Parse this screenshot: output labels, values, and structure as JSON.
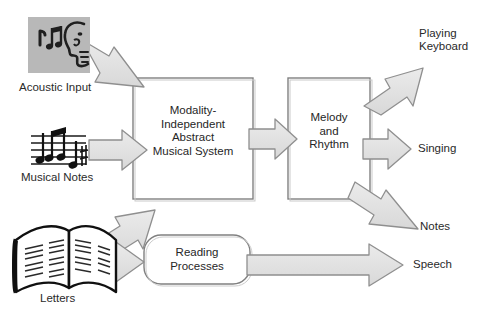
{
  "diagram": {
    "colors": {
      "arrow_fill": "#e2e2e2",
      "arrow_stroke": "#8a8a8a",
      "box_stroke": "#7d7d7d",
      "box_fill": "#ffffff",
      "text": "#2a2a2a",
      "icon_panel_bg": "#b7b7b7",
      "ink": "#1a1a1a"
    },
    "inputs": [
      {
        "id": "acoustic",
        "label": "Acoustic Input",
        "icon": "face-listening-music-icon"
      },
      {
        "id": "musical-notes",
        "label": "Musical Notes",
        "icon": "music-staff-icon"
      },
      {
        "id": "letters",
        "label": "Letters",
        "icon": "open-book-icon"
      }
    ],
    "processes": [
      {
        "id": "mias",
        "label_lines": [
          "Modality-",
          "Independent",
          "Abstract",
          "Musical System"
        ],
        "shape": "rectangle"
      },
      {
        "id": "melody-rhythm",
        "label_lines": [
          "Melody",
          "and",
          "Rhythm"
        ],
        "shape": "rectangle"
      },
      {
        "id": "reading",
        "label_lines": [
          "Reading",
          "Processes"
        ],
        "shape": "rounded-rectangle"
      }
    ],
    "outputs": [
      {
        "id": "playing-keyboard",
        "label_lines": [
          "Playing",
          "Keyboard"
        ]
      },
      {
        "id": "singing",
        "label_lines": [
          "Singing"
        ]
      },
      {
        "id": "notes",
        "label_lines": [
          "Notes"
        ]
      },
      {
        "id": "speech",
        "label_lines": [
          "Speech"
        ]
      }
    ],
    "arrows": [
      {
        "id": "acoustic-to-mias",
        "from": "acoustic",
        "to": "mias",
        "direction": "down-right"
      },
      {
        "id": "notes-to-mias",
        "from": "musical-notes",
        "to": "mias",
        "direction": "right"
      },
      {
        "id": "letters-to-mias",
        "from": "letters",
        "to": "mias",
        "direction": "up-right"
      },
      {
        "id": "letters-to-reading",
        "from": "letters",
        "to": "reading",
        "direction": "right"
      },
      {
        "id": "mias-to-melody",
        "from": "mias",
        "to": "melody-rhythm",
        "direction": "right"
      },
      {
        "id": "melody-to-playing-keyboard",
        "from": "melody-rhythm",
        "to": "playing-keyboard",
        "direction": "up-right"
      },
      {
        "id": "melody-to-singing",
        "from": "melody-rhythm",
        "to": "singing",
        "direction": "right"
      },
      {
        "id": "melody-to-notes",
        "from": "melody-rhythm",
        "to": "notes",
        "direction": "down-right"
      },
      {
        "id": "reading-to-speech",
        "from": "reading",
        "to": "speech",
        "direction": "right"
      }
    ]
  }
}
